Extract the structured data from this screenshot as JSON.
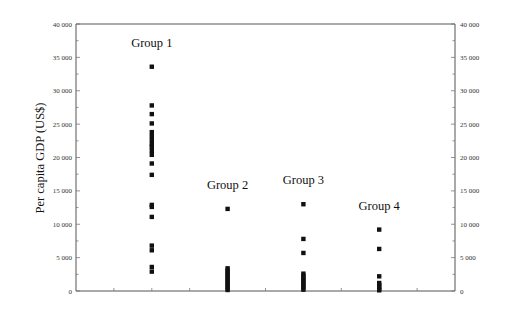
{
  "chart_data": {
    "type": "scatter",
    "title": "",
    "xlabel": "",
    "ylabel": "Per capita GDP (US$)",
    "ylim": [
      0,
      40000
    ],
    "yticks": [
      0,
      5000,
      10000,
      15000,
      20000,
      25000,
      30000,
      35000,
      40000
    ],
    "ytick_labels": [
      "0",
      "5 000",
      "10 000",
      "15 000",
      "20 000",
      "25 000",
      "30 000",
      "35 000",
      "40 000"
    ],
    "right_axis_mirrored": true,
    "grid": false,
    "legend": "none",
    "x_slots": 10,
    "series": [
      {
        "name": "Group 1",
        "x_slot": 2,
        "values": [
          33600,
          27800,
          26500,
          25100,
          23800,
          23200,
          22600,
          22000,
          21600,
          21000,
          20400,
          19100,
          17400,
          12900,
          12600,
          11100,
          6800,
          6100,
          3600,
          2900
        ]
      },
      {
        "name": "Group 2",
        "x_slot": 4,
        "values": [
          12300,
          3400,
          3100,
          2800,
          2500,
          2200,
          1900,
          1600,
          1300,
          1000,
          700,
          400,
          150
        ]
      },
      {
        "name": "Group 3",
        "x_slot": 6,
        "values": [
          13000,
          7800,
          5700,
          2600,
          2300,
          2000,
          1700,
          1400,
          1100,
          800,
          500,
          200
        ]
      },
      {
        "name": "Group 4",
        "x_slot": 8,
        "values": [
          9200,
          6300,
          2200,
          1200,
          900,
          600,
          300,
          100
        ]
      }
    ]
  }
}
